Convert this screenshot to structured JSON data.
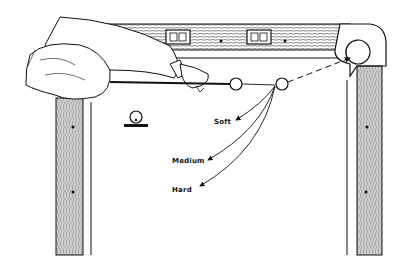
{
  "figure": {
    "labels": {
      "soft": "Soft",
      "medium": "Medium",
      "hard": "Hard"
    },
    "icons": {
      "ball_diagram": "cue-ball-side-view-icon",
      "diamonds": "rail-diamond-icon",
      "nameplates": "rail-nameplate-icon"
    },
    "colors": {
      "ink": "#111111",
      "paper": "#ffffff",
      "wood_hatch": "#333333"
    }
  }
}
